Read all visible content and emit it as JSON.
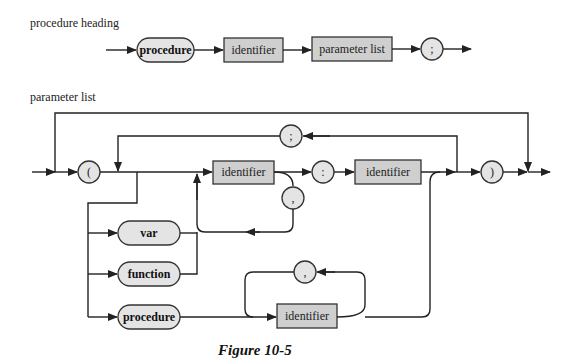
{
  "diagrams": {
    "procedure_heading": {
      "title": "procedure heading",
      "nodes": [
        {
          "kind": "keyword",
          "text": "procedure"
        },
        {
          "kind": "nonterminal",
          "text": "identifier"
        },
        {
          "kind": "nonterminal",
          "text": "parameter list"
        },
        {
          "kind": "symbol",
          "text": ";"
        }
      ]
    },
    "parameter_list": {
      "title": "parameter list",
      "open_paren": "(",
      "close_paren": ")",
      "group_separator": ";",
      "name_separator": ",",
      "type_colon": ":",
      "identifier": "identifier",
      "type_identifier": "identifier",
      "keywords": {
        "var": "var",
        "function": "function",
        "procedure": "procedure"
      },
      "proc_identifier": "identifier",
      "proc_separator": ","
    }
  },
  "caption": "Figure 10-5"
}
